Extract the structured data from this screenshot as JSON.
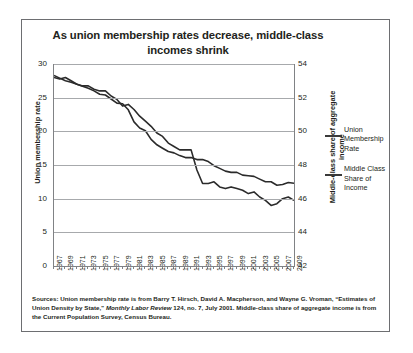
{
  "title": "As union membership rates decrease, middle-class incomes shrink",
  "legend": [
    {
      "label": "Union Membership Rate",
      "color": "#3a3a3a"
    },
    {
      "label": "Middle Class Share of Income",
      "color": "#3a3a3a"
    }
  ],
  "source": {
    "part1": "Sources: Union membership rate is from Barry T. Hirsch, David A. Macpherson, and Wayne G. Vroman, “Estimates of Union Density by State,” ",
    "italic": "Monthly Labor Review",
    "part2": " 124, no. 7, July 2001. Middle-class share of aggregate income is from the Current Population Survey, Census Bureau."
  },
  "chart_data": {
    "type": "line",
    "title": "As union membership rates decrease, middle-class incomes shrink",
    "xlabel": "",
    "ylabel": "Union membership rate",
    "y2label": "Middle-class share of aggregate income",
    "ylim": [
      0,
      30
    ],
    "y2lim": [
      42,
      54
    ],
    "yticks": [
      0,
      5,
      10,
      15,
      20,
      25,
      30
    ],
    "y2ticks": [
      42,
      44,
      46,
      48,
      50,
      52,
      54
    ],
    "grid": true,
    "legend_position": "right",
    "x": [
      1967,
      1968,
      1969,
      1970,
      1971,
      1972,
      1973,
      1974,
      1975,
      1976,
      1977,
      1978,
      1979,
      1980,
      1981,
      1982,
      1983,
      1984,
      1985,
      1986,
      1987,
      1988,
      1989,
      1990,
      1991,
      1992,
      1993,
      1994,
      1995,
      1996,
      1997,
      1998,
      1999,
      2000,
      2001,
      2002,
      2003,
      2004,
      2005,
      2006,
      2007,
      2008,
      2009
    ],
    "xticklabels": [
      1967,
      1969,
      1971,
      1973,
      1975,
      1977,
      1979,
      1981,
      1983,
      1985,
      1987,
      1989,
      1991,
      1993,
      1995,
      1997,
      1999,
      2001,
      2003,
      2005,
      2007,
      2009
    ],
    "series": [
      {
        "name": "Union Membership Rate",
        "axis": "left",
        "values": [
          28.3,
          27.9,
          27.5,
          27.3,
          27.0,
          26.7,
          26.4,
          26.0,
          25.5,
          25.4,
          24.8,
          24.2,
          24.1,
          23.2,
          21.4,
          20.5,
          20.1,
          18.8,
          18.0,
          17.5,
          17.0,
          16.8,
          16.4,
          16.1,
          16.1,
          15.8,
          15.8,
          15.5,
          14.9,
          14.5,
          14.1,
          13.9,
          13.9,
          13.5,
          13.4,
          13.3,
          12.9,
          12.5,
          12.5,
          12.0,
          12.1,
          12.4,
          12.3
        ]
      },
      {
        "name": "Middle Class Share of Income",
        "axis": "right",
        "values": [
          53.2,
          53.1,
          53.2,
          53.0,
          52.8,
          52.7,
          52.7,
          52.5,
          52.4,
          52.4,
          52.1,
          51.9,
          51.5,
          51.6,
          51.3,
          50.9,
          50.6,
          50.3,
          49.9,
          49.7,
          49.3,
          49.1,
          48.9,
          48.9,
          48.9,
          47.7,
          46.9,
          46.9,
          47.0,
          46.7,
          46.6,
          46.7,
          46.6,
          46.5,
          46.3,
          46.4,
          46.1,
          45.9,
          45.6,
          45.7,
          46.0,
          46.1,
          45.9
        ]
      }
    ]
  }
}
